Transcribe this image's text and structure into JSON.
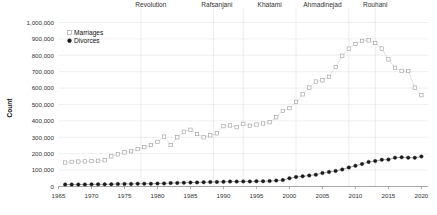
{
  "chart_data": {
    "type": "scatter",
    "title": "",
    "xlabel": "",
    "ylabel": "Count",
    "xlim": [
      1965,
      2021
    ],
    "ylim": [
      0,
      1000000
    ],
    "grid": true,
    "legend_position": "top-left",
    "xticks": [
      "1965",
      "1970",
      "1975",
      "1980",
      "1985",
      "1990",
      "1995",
      "2000",
      "2005",
      "2010",
      "2015",
      "2020"
    ],
    "xtick_values": [
      1965,
      1970,
      1975,
      1980,
      1985,
      1990,
      1995,
      2000,
      2005,
      2010,
      2015,
      2020
    ],
    "yticks": [
      "0",
      "100,000",
      "200,000",
      "300,000",
      "400,000",
      "500,000",
      "600,000",
      "700,000",
      "800,000",
      "900,000",
      "1,000,000"
    ],
    "ytick_values": [
      0,
      100000,
      200000,
      300000,
      400000,
      500000,
      600000,
      700000,
      800000,
      900000,
      1000000
    ],
    "x": [
      1966,
      1967,
      1968,
      1969,
      1970,
      1971,
      1972,
      1973,
      1974,
      1975,
      1976,
      1977,
      1978,
      1979,
      1980,
      1981,
      1982,
      1983,
      1984,
      1985,
      1986,
      1987,
      1988,
      1989,
      1990,
      1991,
      1992,
      1993,
      1994,
      1995,
      1996,
      1997,
      1998,
      1999,
      2000,
      2001,
      2002,
      2003,
      2004,
      2005,
      2006,
      2007,
      2008,
      2009,
      2010,
      2011,
      2012,
      2013,
      2014,
      2015,
      2016,
      2017,
      2018,
      2019,
      2020
    ],
    "series": [
      {
        "name": "Marriages",
        "marker": "open-square",
        "color": "#9b9b9b",
        "values": [
          146000,
          150000,
          152000,
          153000,
          155000,
          157000,
          160000,
          184000,
          196000,
          208000,
          215000,
          228000,
          240000,
          253000,
          272000,
          304000,
          253000,
          300000,
          334000,
          346000,
          320000,
          300000,
          312000,
          324000,
          368000,
          372000,
          362000,
          382000,
          371000,
          378000,
          384000,
          392000,
          422000,
          461000,
          478000,
          516000,
          562000,
          603000,
          640000,
          647000,
          669000,
          729000,
          797000,
          841000,
          869000,
          888000,
          891000,
          875000,
          841000,
          775000,
          724000,
          705000,
          704000,
          603000,
          557000
        ]
      },
      {
        "name": "Divorces",
        "marker": "filled-circle",
        "color": "#1a1a1a",
        "values": [
          12000,
          12000,
          12000,
          12000,
          13000,
          13000,
          13000,
          14000,
          15000,
          16000,
          16000,
          17000,
          17000,
          17000,
          18000,
          19000,
          21000,
          22000,
          23000,
          24000,
          25000,
          26000,
          27000,
          28000,
          29000,
          30000,
          30000,
          31000,
          31000,
          32000,
          32000,
          33000,
          36000,
          39000,
          50000,
          58000,
          62000,
          67000,
          72000,
          82000,
          89000,
          95000,
          104000,
          116000,
          126000,
          137000,
          150000,
          155000,
          163000,
          164000,
          176000,
          178000,
          176000,
          175000,
          183000
        ]
      }
    ],
    "era_labels": [
      {
        "label": "Revolution",
        "x": 1979
      },
      {
        "label": "Rafsanjani",
        "x": 1989
      },
      {
        "label": "Khatami",
        "x": 1997
      },
      {
        "label": "Ahmadinejad",
        "x": 2005
      },
      {
        "label": "Rouhani",
        "x": 2013
      }
    ],
    "era_dividers": [
      1977.5,
      1988.5,
      1993.0,
      2001.0,
      2009.0,
      2013.0
    ]
  },
  "legend": {
    "items": [
      {
        "label": "Marriages",
        "marker": "open-square"
      },
      {
        "label": "Divorces",
        "marker": "filled-circle"
      }
    ]
  }
}
